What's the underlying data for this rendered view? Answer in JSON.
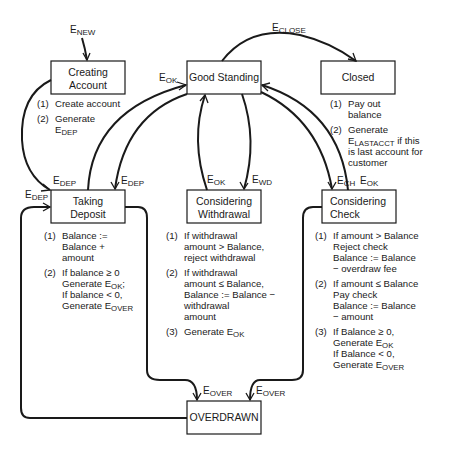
{
  "states": {
    "creating_account": {
      "lines": [
        "Creating",
        "Account"
      ]
    },
    "good_standing": {
      "lines": [
        "Good Standing"
      ]
    },
    "closed": {
      "lines": [
        "Closed"
      ]
    },
    "taking_deposit": {
      "lines": [
        "Taking",
        "Deposit"
      ]
    },
    "considering_withdrawal": {
      "lines": [
        "Considering",
        "Withdrawal"
      ]
    },
    "considering_check": {
      "lines": [
        "Considering",
        "Check"
      ]
    },
    "overdrawn": {
      "lines": [
        "OVERDRAWN"
      ]
    }
  },
  "events": {
    "new": {
      "base": "E",
      "sub": "NEW"
    },
    "close": {
      "base": "E",
      "sub": "CLOSE"
    },
    "ok_deposit_to_good": {
      "base": "E",
      "sub": "OK"
    },
    "dep_good_to_deposit": {
      "base": "E",
      "sub": "DEP"
    },
    "dep_creating_to_deposit": {
      "base": "E",
      "sub": "DEP"
    },
    "dep_overdrawn_to_deposit": {
      "base": "E",
      "sub": "DEP"
    },
    "ok_withdrawal_to_good": {
      "base": "E",
      "sub": "OK"
    },
    "wd_good_to_withdrawal": {
      "base": "E",
      "sub": "WD"
    },
    "ch_good_to_check": {
      "base": "E",
      "sub": "CH"
    },
    "ok_check_to_good": {
      "base": "E",
      "sub": "OK"
    },
    "over_withdrawal_to_overdrawn": {
      "base": "E",
      "sub": "OVER"
    },
    "over_check_to_overdrawn": {
      "base": "E",
      "sub": "OVER"
    }
  },
  "actions": {
    "creating_account": [
      {
        "num": "(1)",
        "lines": [
          [
            "Create account"
          ]
        ]
      },
      {
        "num": "(2)",
        "lines": [
          [
            "Generate"
          ],
          [
            "E",
            "DEP"
          ]
        ]
      }
    ],
    "closed": [
      {
        "num": "(1)",
        "lines": [
          [
            "Pay out"
          ],
          [
            "balance"
          ]
        ]
      },
      {
        "num": "(2)",
        "lines": [
          [
            "Generate"
          ],
          [
            "E",
            "LASTACCT",
            " if this"
          ],
          [
            "is last account for"
          ],
          [
            "customer"
          ]
        ]
      }
    ],
    "taking_deposit": [
      {
        "num": "(1)",
        "lines": [
          [
            "Balance :="
          ],
          [
            "Balance +"
          ],
          [
            "amount"
          ]
        ]
      },
      {
        "num": "(2)",
        "lines": [
          [
            "If balance ≥ 0"
          ],
          [
            "Generate E",
            "OK",
            ";"
          ],
          [
            "If balance < 0,"
          ],
          [
            "Generate E",
            "OVER"
          ]
        ]
      }
    ],
    "considering_withdrawal": [
      {
        "num": "(1)",
        "lines": [
          [
            "If withdrawal"
          ],
          [
            "amount > Balance,"
          ],
          [
            "reject withdrawal"
          ]
        ]
      },
      {
        "num": "(2)",
        "lines": [
          [
            "If withdrawal"
          ],
          [
            "amount ≤ Balance,"
          ],
          [
            "Balance := Balance −"
          ],
          [
            "withdrawal"
          ],
          [
            "amount"
          ]
        ]
      },
      {
        "num": "(3)",
        "lines": [
          [
            "Generate E",
            "OK"
          ]
        ]
      }
    ],
    "considering_check": [
      {
        "num": "(1)",
        "lines": [
          [
            "If amount > Balance"
          ],
          [
            "Reject check"
          ],
          [
            "Balance := Balance"
          ],
          [
            "− overdraw fee"
          ]
        ]
      },
      {
        "num": "(2)",
        "lines": [
          [
            "If amount ≤ Balance"
          ],
          [
            "Pay check"
          ],
          [
            "Balance := Balance"
          ],
          [
            "− amount"
          ]
        ]
      },
      {
        "num": "(3)",
        "lines": [
          [
            "If Balance ≥ 0,"
          ],
          [
            "Generate E",
            "OK"
          ],
          [
            "If Balance < 0,"
          ],
          [
            "Generate E",
            "OVER"
          ]
        ]
      }
    ]
  }
}
